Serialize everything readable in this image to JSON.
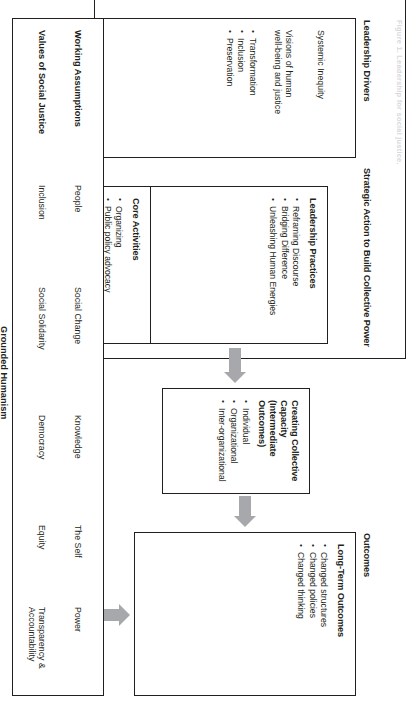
{
  "caption": "Figure 1.  Leadership for social justice.",
  "headers": {
    "drivers": "Leadership Drivers",
    "strategic": "Strategic Action to Build Collective Power",
    "outcomes": "Outcomes"
  },
  "drivers": {
    "driver_1": "Systemic Inequity",
    "driver_2_line1": "Visions of human",
    "driver_2_line2": "well-being and justice",
    "bullets": [
      "Transformation",
      "Inclusion",
      "Preservation"
    ]
  },
  "practices": {
    "title": "Leadership Practices",
    "bullets": [
      "Reframing Discourse",
      "Bridging Difference",
      "Unleashing Human Energies"
    ]
  },
  "activities": {
    "title": "Core Activities",
    "bullets": [
      "Organizing",
      "Public policy advocacy",
      "Community building",
      "Service provision"
    ]
  },
  "capacity": {
    "title_line1": "Creating Collective Capacity",
    "title_line2": "(Intermediate Outcomes)",
    "bullets": [
      "Individual",
      "Organizational",
      "Inter-organizational"
    ]
  },
  "long_term_outcomes": {
    "title": "Long-Term Outcomes",
    "bullets": [
      "Changed structures",
      "Changed policies",
      "Changed thinking"
    ]
  },
  "grounded_humanism": {
    "caption": "Grounded Humanism",
    "row_labels": {
      "assumptions": "Working Assumptions",
      "values": "Values of Social Justice"
    },
    "working_assumptions": [
      "People",
      "Social Change",
      "Knowledge",
      "The Self",
      "Power"
    ],
    "values_of_social_justice": [
      "Inclusion",
      "Social Solidarity",
      "Democracy",
      "Equity",
      "Transparency & Accountability"
    ]
  },
  "colors": {
    "ink": "#231f20",
    "arrow": "#a6a8ab",
    "paper": "#ffffff"
  }
}
